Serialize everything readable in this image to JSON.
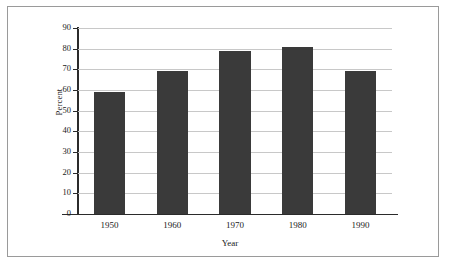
{
  "figure": {
    "frame_border_color": "#9a9a9a",
    "background_color": "#ffffff"
  },
  "chart_data": {
    "type": "bar",
    "title": "",
    "xlabel": "Year",
    "ylabel": "Percent",
    "categories": [
      "1950",
      "1960",
      "1970",
      "1980",
      "1990"
    ],
    "values": [
      59,
      69,
      79,
      81,
      69
    ],
    "series": [
      {
        "name": "Percent",
        "values": [
          59,
          69,
          79,
          81,
          69
        ]
      }
    ],
    "ylim": [
      0,
      90
    ],
    "ytick_step": 10,
    "yticks": [
      "0",
      "10",
      "20",
      "30",
      "40",
      "50",
      "60",
      "70",
      "80",
      "90"
    ],
    "grid": "horizontal",
    "gridline_color": "#c8c8c8",
    "legend": "none",
    "bar_color": "#3a3a3a",
    "axis_color": "#2b2b2b"
  },
  "scan_artifact": {
    "clipped_header_text": ""
  }
}
